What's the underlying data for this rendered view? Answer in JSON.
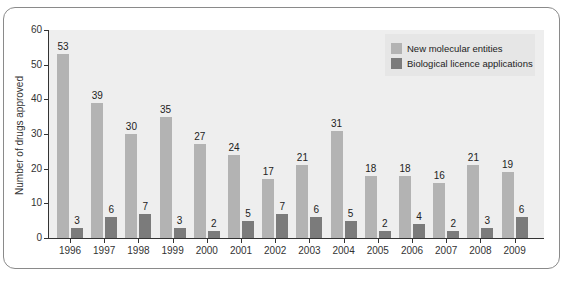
{
  "chart_data": {
    "type": "bar",
    "title": "",
    "xlabel": "",
    "ylabel": "Number of drugs approved",
    "ylim": [
      0,
      60
    ],
    "yticks": [
      0,
      10,
      20,
      30,
      40,
      50,
      60
    ],
    "grid": false,
    "legend_position": "top-right",
    "categories": [
      "1996",
      "1997",
      "1998",
      "1999",
      "2000",
      "2001",
      "2002",
      "2003",
      "2004",
      "2005",
      "2006",
      "2007",
      "2008",
      "2009"
    ],
    "series": [
      {
        "name": "New molecular entities",
        "color": "#b3b3b3",
        "values": [
          53,
          39,
          30,
          35,
          27,
          24,
          17,
          21,
          31,
          18,
          18,
          16,
          21,
          19
        ]
      },
      {
        "name": "Biological licence applications",
        "color": "#7b7b7b",
        "values": [
          3,
          6,
          7,
          3,
          2,
          5,
          7,
          6,
          5,
          2,
          4,
          2,
          3,
          6
        ]
      }
    ]
  }
}
